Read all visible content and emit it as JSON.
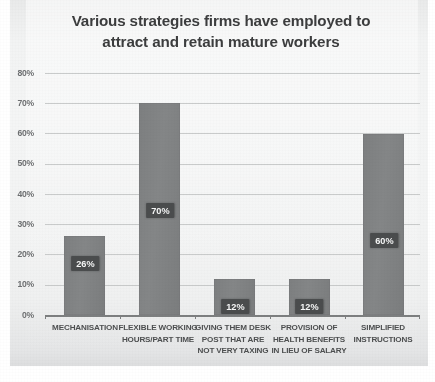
{
  "chart_data": {
    "type": "bar",
    "title": "Various strategies firms have employed to attract and retain mature workers",
    "title_lines": [
      "Various strategies firms have employed to",
      "attract and retain mature workers"
    ],
    "categories": [
      "MECHANISATION",
      "FLEXIBLE WORKING HOURS/PART TIME",
      "GIVING THEM DESK POST THAT ARE NOT VERY TAXING",
      "PROVISION OF HEALTH BENEFITS IN LIEU OF SALARY",
      "SIMPLIFIED INSTRUCTIONS"
    ],
    "category_lines": [
      [
        "MECHANISATION"
      ],
      [
        "FLEXIBLE WORKING",
        "HOURS/PART TIME"
      ],
      [
        "GIVING THEM DESK",
        "POST THAT ARE",
        "NOT VERY TAXING"
      ],
      [
        "PROVISION OF",
        "HEALTH BENEFITS",
        "IN LIEU OF SALARY"
      ],
      [
        "SIMPLIFIED",
        "INSTRUCTIONS"
      ]
    ],
    "values": [
      26,
      70,
      12,
      12,
      60
    ],
    "value_labels": [
      "26%",
      "70%",
      "12%",
      "12%",
      "60%"
    ],
    "xlabel": "",
    "ylabel": "",
    "ylim": [
      0,
      80
    ],
    "ytick_values": [
      0,
      10,
      20,
      30,
      40,
      50,
      60,
      70,
      80
    ],
    "ytick_labels": [
      "0%",
      "10%",
      "20%",
      "30%",
      "40%",
      "50%",
      "60%",
      "70%",
      "80%"
    ],
    "grid": "horizontal",
    "legend": "none",
    "colors": {
      "bar_fill": "#808283",
      "label_badge": "#4a4c4d",
      "label_text": "#f6f7f7",
      "title_text": "#3c3d3e",
      "axis_text": "#6e7072",
      "gridline": "#c9cbcb",
      "axis_line": "#7d7f80",
      "plot_background": "#f3f4f4"
    }
  }
}
